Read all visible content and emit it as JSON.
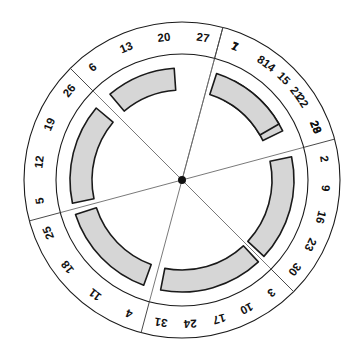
{
  "diagram": {
    "name": "circular-day-wheel",
    "title": "",
    "center": {
      "x": 182,
      "y": 180
    },
    "radii": {
      "outer_ring": 158,
      "inner_ring": 126,
      "band_outer": 112,
      "band_inner": 90
    },
    "colors": {
      "band_fill": "#d6d6d6",
      "stroke": "#1a1a1a",
      "divider": "#4a4a4a",
      "spoke": "#6a6a6a",
      "hub": "#111111",
      "background": "#ffffff"
    },
    "sector_count": 6,
    "sectors": [
      {
        "id": "sector-top",
        "name": "top",
        "start_angle": -75,
        "end_angle": -15,
        "labels": [
          "1",
          "8",
          "15",
          "22",
          "29"
        ],
        "band": {
          "start_angle": -62,
          "end_angle": -26
        }
      },
      {
        "id": "sector-upper-right",
        "name": "upper-right",
        "start_angle": -15,
        "end_angle": 45,
        "labels": [
          "2",
          "9",
          "16",
          "23",
          "30"
        ],
        "band": {
          "start_angle": -12,
          "end_angle": 43
        }
      },
      {
        "id": "sector-lower-right",
        "name": "lower-right",
        "start_angle": 45,
        "end_angle": 105,
        "labels": [
          "3",
          "10",
          "17",
          "24",
          "31"
        ],
        "band": {
          "start_angle": 47,
          "end_angle": 101
        }
      },
      {
        "id": "sector-bottom-right",
        "name": "bottom-right",
        "start_angle": 105,
        "end_angle": 165,
        "labels": [
          "4",
          "11",
          "18",
          "25"
        ],
        "band": {
          "start_angle": 110,
          "end_angle": 162
        }
      },
      {
        "id": "sector-bottom-left",
        "name": "bottom-left",
        "start_angle": 165,
        "end_angle": 225,
        "labels": [
          "5",
          "12",
          "19",
          "26"
        ],
        "band": {
          "start_angle": 168,
          "end_angle": 220
        }
      },
      {
        "id": "sector-left",
        "name": "left",
        "start_angle": 225,
        "end_angle": 285,
        "labels": [
          "6",
          "13",
          "20",
          "27"
        ],
        "band": {
          "start_angle": 230,
          "end_angle": 266
        }
      },
      {
        "id": "sector-upper-left",
        "name": "upper-left",
        "start_angle": 285,
        "end_angle": 345,
        "labels": [
          "7",
          "14",
          "21",
          "28"
        ],
        "band": {
          "start_angle": 288,
          "end_angle": 330
        }
      }
    ]
  }
}
